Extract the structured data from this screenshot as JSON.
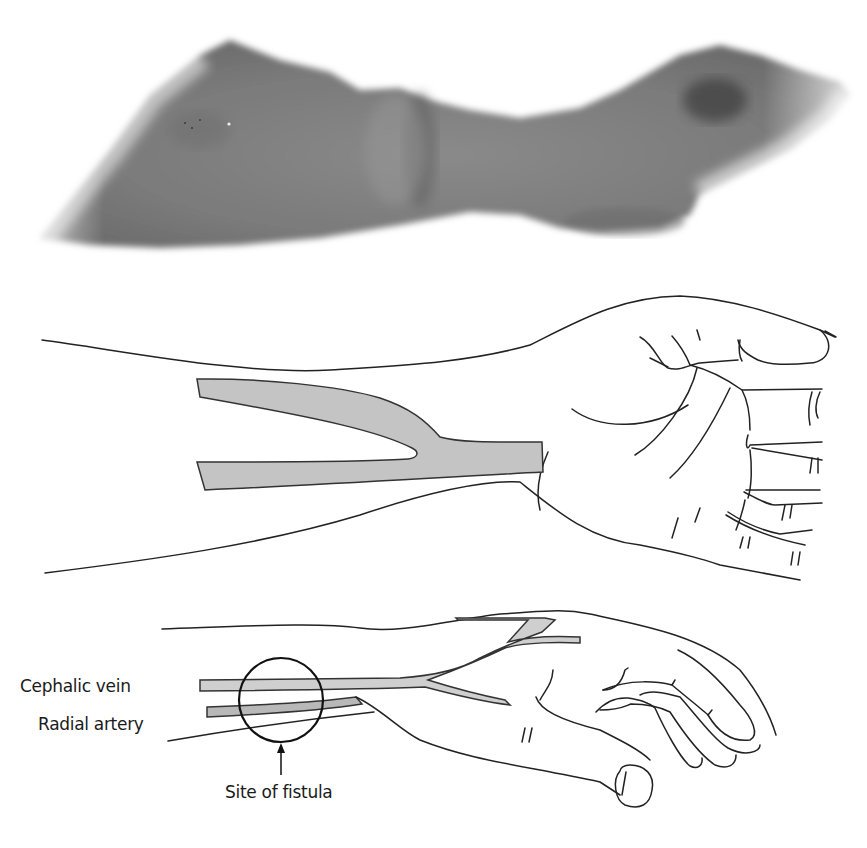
{
  "figure": {
    "panels": [
      {
        "id": "photo",
        "description": "Grayscale photograph of forearm and wrist with arteriovenous fistula"
      },
      {
        "id": "vessel-diagram",
        "description": "Line drawing of forearm and hand showing joined vessel (Y-shaped anastomosis)"
      },
      {
        "id": "fistula-diagram",
        "description": "Side-view line drawing of forearm and hand with labeled vessels and fistula site"
      }
    ],
    "labels": {
      "cephalic_vein": "Cephalic vein",
      "radial_artery": "Radial artery",
      "site_of_fistula": "Site of fistula"
    },
    "colors": {
      "vessel_fill": "#c4c4c4",
      "line": "#222222",
      "skin_photo": "#7a7a7a",
      "background": "#ffffff"
    }
  }
}
